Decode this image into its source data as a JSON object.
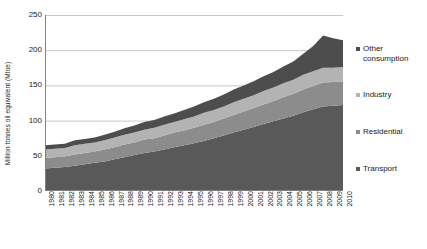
{
  "chart_data": {
    "type": "area",
    "stacked": true,
    "title": "",
    "subtitle": "",
    "xlabel": "",
    "ylabel": "Million tonnes oil equivalent (Mtoe)",
    "ylim": [
      0,
      250
    ],
    "yticks": [
      0,
      50,
      100,
      150,
      200,
      250
    ],
    "ytick_labels": [
      "0",
      "50",
      "100",
      "150",
      "200",
      "250"
    ],
    "grid": true,
    "grid_axis": "y",
    "legend_position": "right",
    "categories": [
      "1980",
      "1981",
      "1982",
      "1983",
      "1984",
      "1985",
      "1986",
      "1987",
      "1988",
      "1989",
      "1990",
      "1991",
      "1992",
      "1993",
      "1994",
      "1995",
      "1996",
      "1997",
      "1998",
      "1999",
      "2000",
      "2001",
      "2002",
      "2003",
      "2004",
      "2005",
      "2006",
      "2007",
      "2008",
      "2009",
      "2010"
    ],
    "series": [
      {
        "name": "Transport",
        "color": "#595959",
        "values": [
          32,
          33,
          34,
          36,
          38,
          40,
          42,
          45,
          48,
          51,
          54,
          56,
          59,
          62,
          65,
          68,
          71,
          75,
          79,
          83,
          87,
          91,
          95,
          99,
          103,
          107,
          112,
          116,
          120,
          121,
          122
        ]
      },
      {
        "name": "Residential",
        "color": "#8c8c8c",
        "values": [
          15,
          15,
          15,
          16,
          16,
          16,
          17,
          17,
          18,
          18,
          19,
          19,
          20,
          21,
          21,
          22,
          23,
          23,
          24,
          25,
          26,
          27,
          28,
          29,
          30,
          31,
          32,
          33,
          34,
          34,
          34
        ]
      },
      {
        "name": "Industry",
        "color": "#b3b3b3",
        "values": [
          12,
          12,
          12,
          13,
          13,
          13,
          13,
          14,
          14,
          14,
          14,
          15,
          15,
          15,
          16,
          16,
          17,
          17,
          17,
          18,
          18,
          18,
          19,
          19,
          20,
          20,
          21,
          21,
          21,
          20,
          20
        ]
      },
      {
        "name": "Other consumption",
        "color": "#4d4d4d",
        "values": [
          6,
          6,
          6,
          7,
          7,
          7,
          8,
          8,
          9,
          10,
          11,
          11,
          12,
          12,
          13,
          14,
          15,
          16,
          17,
          18,
          19,
          20,
          21,
          22,
          24,
          26,
          30,
          36,
          46,
          42,
          38
        ]
      }
    ],
    "totals": [
      65,
      66,
      67,
      72,
      74,
      76,
      80,
      84,
      89,
      93,
      98,
      101,
      106,
      110,
      115,
      120,
      126,
      131,
      137,
      144,
      150,
      156,
      163,
      169,
      177,
      184,
      195,
      206,
      221,
      217,
      214
    ]
  },
  "legend": {
    "entries": [
      {
        "label": "Other\nconsumption",
        "color": "#4d4d4d"
      },
      {
        "label": "Industry",
        "color": "#b3b3b3"
      },
      {
        "label": "Residential",
        "color": "#8c8c8c"
      },
      {
        "label": "Transport",
        "color": "#595959"
      }
    ]
  },
  "colors": {
    "grid": "#c8c8c8",
    "axis": "#808080",
    "text": "#1a1a1a",
    "background": "#ffffff"
  }
}
